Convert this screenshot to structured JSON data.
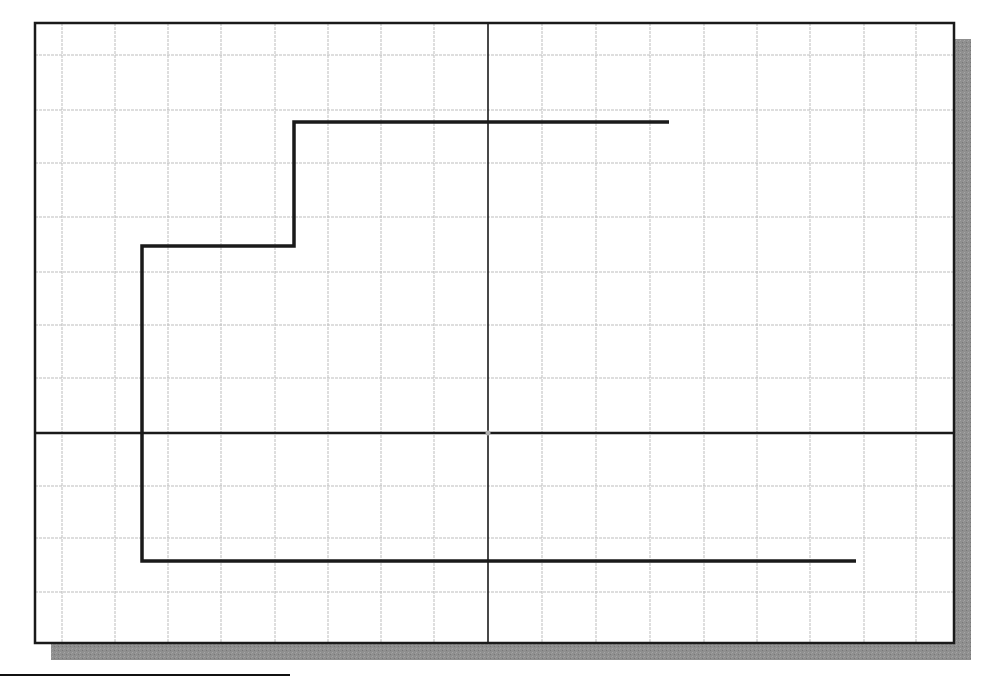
{
  "diagram": {
    "type": "cad-grid-drawing",
    "frame": {
      "x": 35,
      "y": 23,
      "width": 919,
      "height": 620,
      "stroke": "#1a1a1a",
      "stroke_width": 2.5
    },
    "shadow": {
      "offset_x": 16,
      "offset_y": 16,
      "color": "#8c8c8c"
    },
    "grid": {
      "color": "#bdbdbd",
      "vertical_lines_x": [
        62,
        115,
        168,
        221,
        275,
        328,
        381,
        434,
        542,
        596,
        650,
        704,
        757,
        810,
        864,
        916
      ],
      "horizontal_lines_y": [
        55,
        110,
        163,
        217,
        272,
        325,
        378,
        486,
        538,
        592
      ]
    },
    "axes": {
      "origin": {
        "x": 488,
        "y": 433
      },
      "color": "#1a1a1a",
      "stroke_width": 2.5,
      "origin_marker_color": "#b0b0b0"
    },
    "polyline": {
      "name": "stepped-outline",
      "color": "#1a1a1a",
      "stroke_width": 3.5,
      "points": [
        [
          669,
          122
        ],
        [
          294,
          122
        ],
        [
          294,
          246
        ],
        [
          142,
          246
        ],
        [
          142,
          561
        ],
        [
          856,
          561
        ]
      ]
    },
    "underline": {
      "x1": 0,
      "y1": 675,
      "x2": 290,
      "y2": 675,
      "color": "#111111"
    }
  }
}
